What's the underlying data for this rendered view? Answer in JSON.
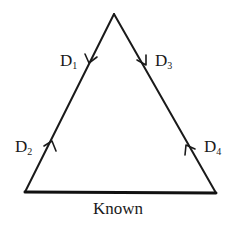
{
  "diagram": {
    "type": "triangle-cycle",
    "vertices": {
      "apex": [
        114,
        14
      ],
      "bottom_left": [
        25,
        192
      ],
      "bottom_right": [
        216,
        193
      ]
    },
    "edges": [
      {
        "id": "left",
        "from": "apex",
        "to": "bottom_left"
      },
      {
        "id": "right",
        "from": "apex",
        "to": "bottom_right"
      },
      {
        "id": "base",
        "from": "bottom_left",
        "to": "bottom_right",
        "label": "Known"
      }
    ],
    "arrows": [
      {
        "label": "D",
        "sub": "1",
        "edge": "left",
        "direction": "down"
      },
      {
        "label": "D",
        "sub": "2",
        "edge": "left",
        "direction": "up"
      },
      {
        "label": "D",
        "sub": "3",
        "edge": "right",
        "direction": "down"
      },
      {
        "label": "D",
        "sub": "4",
        "edge": "right",
        "direction": "up"
      }
    ],
    "labels": {
      "d1_main": "D",
      "d1_sub": "1",
      "d2_main": "D",
      "d2_sub": "2",
      "d3_main": "D",
      "d3_sub": "3",
      "d4_main": "D",
      "d4_sub": "4",
      "base": "Known"
    },
    "colors": {
      "stroke": "#1a1a1a",
      "background": "#ffffff"
    }
  }
}
